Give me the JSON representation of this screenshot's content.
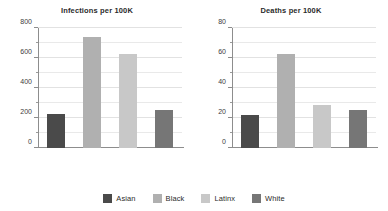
{
  "figure": {
    "background": "#ffffff",
    "grid_color": "#e6e6e6",
    "axis_color": "#8d8d8d"
  },
  "legend": {
    "position": "bottom-center",
    "items": [
      {
        "label": "Asian",
        "color": "#4a4a4a"
      },
      {
        "label": "Black",
        "color": "#b0b0b0"
      },
      {
        "label": "Latinx",
        "color": "#c8c8c8"
      },
      {
        "label": "White",
        "color": "#767676"
      }
    ]
  },
  "chart_data": [
    {
      "type": "bar",
      "title": "Infections per 100K",
      "xlabel": "",
      "ylabel": "",
      "categories": [
        "Asian",
        "Black",
        "Latinx",
        "White"
      ],
      "values": [
        230,
        740,
        630,
        253
      ],
      "colors": [
        "#4a4a4a",
        "#b0b0b0",
        "#c8c8c8",
        "#767676"
      ],
      "ylim": [
        0,
        800
      ],
      "yticks": [
        0,
        200,
        400,
        600,
        800
      ],
      "ytick_labels": [
        "0",
        "200",
        "400",
        "600",
        "800"
      ],
      "yminor_ticks": [
        100,
        300,
        500,
        700
      ],
      "grid": true,
      "legend": "shared-bottom"
    },
    {
      "type": "bar",
      "title": "Deaths per 100K",
      "xlabel": "",
      "ylabel": "",
      "categories": [
        "Asian",
        "Black",
        "Latinx",
        "White"
      ],
      "values": [
        22,
        63,
        28.8,
        25.5
      ],
      "colors": [
        "#4a4a4a",
        "#b0b0b0",
        "#c8c8c8",
        "#767676"
      ],
      "ylim": [
        0,
        80
      ],
      "yticks": [
        0,
        20,
        40,
        60,
        80
      ],
      "ytick_labels": [
        "0",
        "20",
        "40",
        "60",
        "80"
      ],
      "yminor_ticks": [
        10,
        30,
        50,
        70
      ],
      "grid": true,
      "legend": "shared-bottom"
    }
  ]
}
